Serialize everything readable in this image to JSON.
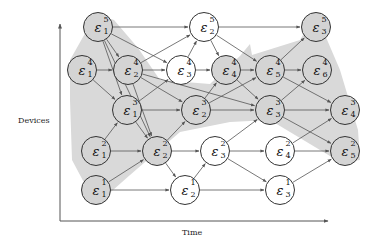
{
  "axes": {
    "x_label": "Time",
    "y_label": "Devices"
  },
  "colors": {
    "shade": "#d9d9d9",
    "node_border": "#333333",
    "edge": "#555555",
    "shaded_node": "#d4d4d4"
  },
  "nodes": [
    {
      "id": "e1_5",
      "symbol": "ε",
      "sub": "1",
      "sup": "5",
      "x": 98,
      "y": 27,
      "shaded": true
    },
    {
      "id": "e2_5",
      "symbol": "ε",
      "sub": "2",
      "sup": "5",
      "x": 204,
      "y": 27,
      "shaded": false
    },
    {
      "id": "e3_5",
      "symbol": "ε",
      "sub": "3",
      "sup": "5",
      "x": 316,
      "y": 27,
      "shaded": true
    },
    {
      "id": "e1_4",
      "symbol": "ε",
      "sub": "1",
      "sup": "4",
      "x": 82,
      "y": 70,
      "shaded": true
    },
    {
      "id": "e2_4",
      "symbol": "ε",
      "sub": "2",
      "sup": "4",
      "x": 128,
      "y": 70,
      "shaded": true
    },
    {
      "id": "e3_4",
      "symbol": "ε",
      "sub": "3",
      "sup": "4",
      "x": 181,
      "y": 70,
      "shaded": false
    },
    {
      "id": "e4_4",
      "symbol": "ε",
      "sub": "4",
      "sup": "4",
      "x": 226,
      "y": 70,
      "shaded": true
    },
    {
      "id": "e5_4",
      "symbol": "ε",
      "sub": "5",
      "sup": "4",
      "x": 270,
      "y": 70,
      "shaded": true
    },
    {
      "id": "e6_4",
      "symbol": "ε",
      "sub": "6",
      "sup": "4",
      "x": 317,
      "y": 70,
      "shaded": true
    },
    {
      "id": "e1_3",
      "symbol": "ε",
      "sub": "1",
      "sup": "3",
      "x": 127,
      "y": 110,
      "shaded": true
    },
    {
      "id": "e2_3",
      "symbol": "ε",
      "sub": "2",
      "sup": "3",
      "x": 196,
      "y": 110,
      "shaded": true
    },
    {
      "id": "e3_3",
      "symbol": "ε",
      "sub": "3",
      "sup": "3",
      "x": 270,
      "y": 110,
      "shaded": true
    },
    {
      "id": "e4_3",
      "symbol": "ε",
      "sub": "4",
      "sup": "3",
      "x": 345,
      "y": 110,
      "shaded": true
    },
    {
      "id": "e1_2",
      "symbol": "ε",
      "sub": "1",
      "sup": "2",
      "x": 96,
      "y": 151,
      "shaded": true
    },
    {
      "id": "e2_2",
      "symbol": "ε",
      "sub": "2",
      "sup": "2",
      "x": 157,
      "y": 151,
      "shaded": true
    },
    {
      "id": "e3_2",
      "symbol": "ε",
      "sub": "3",
      "sup": "2",
      "x": 215,
      "y": 151,
      "shaded": false
    },
    {
      "id": "e4_2",
      "symbol": "ε",
      "sub": "4",
      "sup": "2",
      "x": 280,
      "y": 151,
      "shaded": false
    },
    {
      "id": "e5_2",
      "symbol": "ε",
      "sub": "5",
      "sup": "2",
      "x": 345,
      "y": 151,
      "shaded": true
    },
    {
      "id": "e1_1",
      "symbol": "ε",
      "sub": "1",
      "sup": "1",
      "x": 96,
      "y": 190,
      "shaded": true
    },
    {
      "id": "e2_1",
      "symbol": "ε",
      "sub": "2",
      "sup": "1",
      "x": 185,
      "y": 190,
      "shaded": false
    },
    {
      "id": "e3_1",
      "symbol": "ε",
      "sub": "3",
      "sup": "1",
      "x": 280,
      "y": 190,
      "shaded": false
    }
  ],
  "edges": [
    [
      "e1_5",
      "e2_5"
    ],
    [
      "e2_5",
      "e3_5"
    ],
    [
      "e1_5",
      "e2_4"
    ],
    [
      "e1_5",
      "e3_4"
    ],
    [
      "e1_5",
      "e1_3"
    ],
    [
      "e1_5",
      "e2_2"
    ],
    [
      "e2_5",
      "e4_4"
    ],
    [
      "e2_5",
      "e5_4"
    ],
    [
      "e1_4",
      "e2_4"
    ],
    [
      "e2_4",
      "e3_4"
    ],
    [
      "e3_4",
      "e4_4"
    ],
    [
      "e4_4",
      "e5_4"
    ],
    [
      "e5_4",
      "e6_4"
    ],
    [
      "e1_4",
      "e1_3"
    ],
    [
      "e2_4",
      "e2_5"
    ],
    [
      "e3_4",
      "e2_5"
    ],
    [
      "e5_4",
      "e3_5"
    ],
    [
      "e2_4",
      "e2_3"
    ],
    [
      "e2_4",
      "e2_2"
    ],
    [
      "e2_4",
      "e3_3"
    ],
    [
      "e4_4",
      "e3_3"
    ],
    [
      "e5_4",
      "e4_3"
    ],
    [
      "e1_3",
      "e2_3"
    ],
    [
      "e2_3",
      "e3_3"
    ],
    [
      "e3_3",
      "e4_3"
    ],
    [
      "e1_3",
      "e3_4"
    ],
    [
      "e2_3",
      "e4_4"
    ],
    [
      "e2_3",
      "e5_4"
    ],
    [
      "e3_3",
      "e6_4"
    ],
    [
      "e1_3",
      "e2_2"
    ],
    [
      "e3_3",
      "e5_2"
    ],
    [
      "e1_2",
      "e1_3"
    ],
    [
      "e2_2",
      "e2_3"
    ],
    [
      "e3_2",
      "e3_3"
    ],
    [
      "e4_2",
      "e4_3"
    ],
    [
      "e1_2",
      "e2_2"
    ],
    [
      "e2_2",
      "e3_2"
    ],
    [
      "e3_2",
      "e4_2"
    ],
    [
      "e4_2",
      "e5_2"
    ],
    [
      "e2_2",
      "e2_1"
    ],
    [
      "e3_2",
      "e3_1"
    ],
    [
      "e1_1",
      "e2_2"
    ],
    [
      "e2_1",
      "e3_2"
    ],
    [
      "e3_1",
      "e5_2"
    ],
    [
      "e1_1",
      "e2_1"
    ],
    [
      "e2_1",
      "e3_1"
    ]
  ],
  "shaded_regions": [
    "96,14 114,20 138,48 160,80 210,84 240,56 250,44 252,55 300,40 316,14 340,70 358,130 360,160 340,162 270,120 230,122 180,132 130,175 96,205 72,160 70,100 70,60"
  ]
}
